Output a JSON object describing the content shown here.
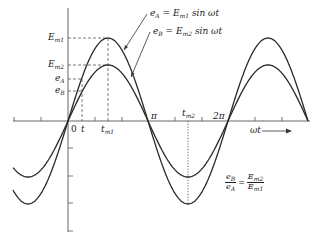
{
  "diagram": {
    "type": "sinusoid-comparison",
    "colors": {
      "curve": "#2a2a2a",
      "axis": "#555555",
      "background": "#ffffff"
    },
    "axis": {
      "x_label": "ωt",
      "x_ticks": [
        "0",
        "t",
        "t_m1",
        "π",
        "t_m2",
        "2π"
      ],
      "y_ticks": [
        "E_m1",
        "E_m2",
        "e_A",
        "e_B"
      ]
    },
    "labels": {
      "Em1": {
        "main": "E",
        "sub": "m1"
      },
      "Em2": {
        "main": "E",
        "sub": "m2"
      },
      "eA": {
        "main": "e",
        "sub": "A"
      },
      "eB": {
        "main": "e",
        "sub": "B"
      },
      "zero": "0",
      "t": "t",
      "tm1": {
        "main": "t",
        "sub": "m1"
      },
      "tm2": {
        "main": "t",
        "sub": "m2"
      },
      "pi": "π",
      "two_pi": "2π",
      "omega_t": "ωt"
    },
    "equations": {
      "eqA": {
        "lhs_main": "e",
        "lhs_sub": "A",
        "eq": " = ",
        "rhs_main": "E",
        "rhs_sub": "m1",
        "rhs_tail": " sin ωt"
      },
      "eqB": {
        "lhs_main": "e",
        "lhs_sub": "B",
        "eq": " = ",
        "rhs_main": "E",
        "rhs_sub": "m2",
        "rhs_tail": " sin ωt"
      },
      "ratio": {
        "left_num_main": "e",
        "left_num_sub": "B",
        "left_den_main": "e",
        "left_den_sub": "A",
        "eq": "=",
        "right_num_main": "E",
        "right_num_sub": "m2",
        "right_den_main": "E",
        "right_den_sub": "m1"
      }
    },
    "series": [
      {
        "name": "e_A",
        "amplitude_label": "E_m1",
        "formula": "e_A = E_m1 sin ωt",
        "relative_amplitude": 1.0
      },
      {
        "name": "e_B",
        "amplitude_label": "E_m2",
        "formula": "e_B = E_m2 sin ωt",
        "relative_amplitude": 0.67
      }
    ]
  }
}
